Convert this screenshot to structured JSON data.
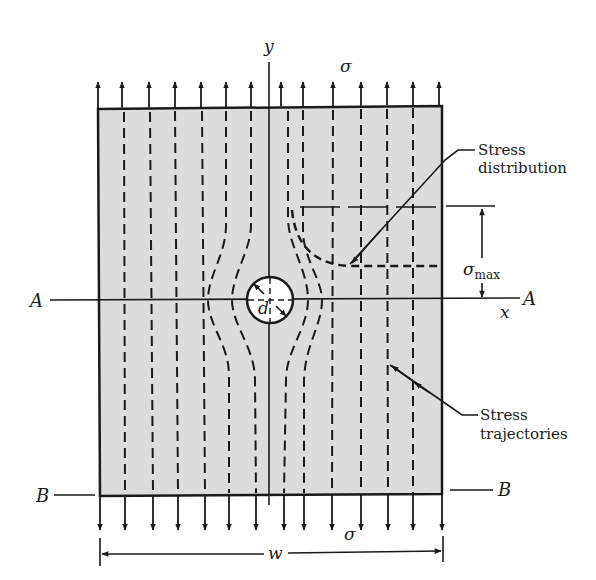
{
  "figure": {
    "colors": {
      "plate_fill": "#dcdcdc",
      "ink": "#1a1a1a",
      "hole_fill": "#ffffff"
    }
  },
  "labels": {
    "y_axis": "y",
    "x_axis": "x",
    "sigma_top": "σ",
    "sigma_bottom": "σ",
    "sigma_max_base": "σ",
    "sigma_max_sub": "max",
    "section_a_left": "A",
    "section_a_right": "A",
    "section_b_left": "B",
    "section_b_right": "B",
    "hole_diameter": "d",
    "width": "w"
  },
  "callouts": {
    "stress_distribution": [
      "Stress",
      "distribution"
    ],
    "stress_trajectories": [
      "Stress",
      "trajectories"
    ]
  },
  "arrows": {
    "top_x": [
      98,
      122,
      149,
      175,
      201,
      226,
      251,
      281,
      303,
      333,
      361,
      387,
      413,
      439
    ],
    "bottom_x": [
      100,
      125,
      153,
      178,
      205,
      229,
      256,
      284,
      304,
      332,
      361,
      388,
      413,
      442
    ]
  }
}
